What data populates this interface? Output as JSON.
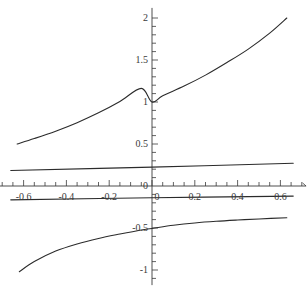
{
  "chart_data": {
    "type": "line",
    "title": "",
    "subtitle": "",
    "xlabel": "x",
    "ylabel": "",
    "xlim": [
      -0.72,
      0.72
    ],
    "ylim": [
      -1.18,
      2.12
    ],
    "grid": false,
    "legend": "none",
    "background": "#ffffff",
    "line_color": "#2b2b2b",
    "axis_color": "#3a3a3a",
    "x_ticks_major": [
      -0.6,
      -0.4,
      -0.2,
      0,
      0.2,
      0.4,
      0.6
    ],
    "x_tick_labels": [
      "-0.6",
      "-0.4",
      "-0.2",
      "0",
      "0.2",
      "0.4",
      "0.6"
    ],
    "x_minor_tick_step": 0.05,
    "y_ticks_major": [
      -1,
      -0.5,
      0,
      0.5,
      1,
      1.5,
      2
    ],
    "y_tick_labels": [
      "-1",
      "-0.5",
      "0",
      "0.5",
      "1",
      "1.5",
      "2"
    ],
    "y_minor_tick_step": 0.1,
    "series": [
      {
        "name": "exponential-curve",
        "x": [
          -0.63,
          -0.55,
          -0.45,
          -0.35,
          -0.25,
          -0.15,
          -0.05,
          0,
          0.05,
          0.15,
          0.25,
          0.35,
          0.45,
          0.55,
          0.63
        ],
        "values": [
          0.5,
          0.565,
          0.653,
          0.754,
          0.871,
          1.006,
          1.162,
          1.0,
          1.075,
          1.19,
          1.32,
          1.47,
          1.63,
          1.82,
          2.0
        ]
      },
      {
        "name": "upper-near-flat-line",
        "x": [
          -0.66,
          0,
          0.66
        ],
        "values": [
          0.185,
          0.225,
          0.27
        ]
      },
      {
        "name": "lower-near-flat-line",
        "x": [
          -0.66,
          0,
          0.66
        ],
        "values": [
          -0.165,
          -0.14,
          -0.12
        ]
      },
      {
        "name": "logarithmic-curve",
        "x": [
          -0.62,
          -0.55,
          -0.45,
          -0.35,
          -0.25,
          -0.15,
          -0.05,
          0,
          0.1,
          0.2,
          0.3,
          0.4,
          0.5,
          0.63
        ],
        "values": [
          -1.02,
          -0.9,
          -0.775,
          -0.69,
          -0.625,
          -0.572,
          -0.523,
          -0.505,
          -0.468,
          -0.44,
          -0.42,
          -0.405,
          -0.392,
          -0.378
        ]
      }
    ]
  },
  "axes": {
    "x_axis_name": "x",
    "y_axis_name": ""
  },
  "x_tick_labels": [
    {
      "text": "-0.6",
      "value": -0.6
    },
    {
      "text": "-0.4",
      "value": -0.4
    },
    {
      "text": "-0.2",
      "value": -0.2
    },
    {
      "text": "0",
      "value": 0
    },
    {
      "text": "0.2",
      "value": 0.2
    },
    {
      "text": "0.4",
      "value": 0.4
    },
    {
      "text": "0.6",
      "value": 0.6
    }
  ],
  "y_tick_labels": [
    {
      "text": "2",
      "value": 2
    },
    {
      "text": "1.5",
      "value": 1.5
    },
    {
      "text": "1",
      "value": 1
    },
    {
      "text": "0.5",
      "value": 0.5
    },
    {
      "text": "0",
      "value": 0
    },
    {
      "text": "-0.5",
      "value": -0.5
    },
    {
      "text": "-1",
      "value": -1
    }
  ]
}
